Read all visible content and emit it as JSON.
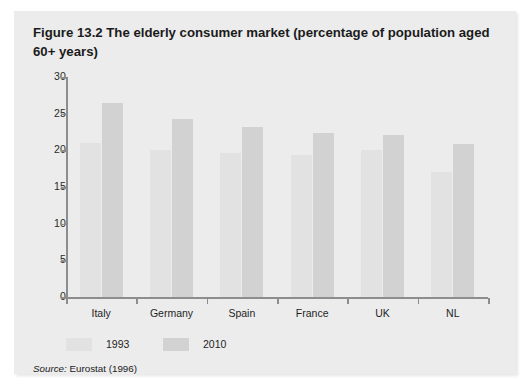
{
  "figure": {
    "label": "Figure 13.2",
    "caption": "The elderly consumer market (percentage of population aged 60+ years)",
    "source_label": "Source:",
    "source_text": "Eurostat (1996)"
  },
  "colors": {
    "card_background": "#ececec",
    "series_1993": "#e2e2e2",
    "series_2010": "#d2d2d2",
    "axis": "#8d8d8d",
    "text": "#1f1f1f"
  },
  "chart_data": {
    "type": "bar",
    "title": "Figure 13.2 The elderly consumer market (percentage of population aged 60+ years)",
    "xlabel": "",
    "ylabel": "",
    "ylim": [
      0,
      30
    ],
    "yticks": [
      0,
      5,
      10,
      15,
      20,
      25,
      30
    ],
    "grid": false,
    "legend_position": "bottom-left",
    "categories": [
      "Italy",
      "Germany",
      "Spain",
      "France",
      "UK",
      "NL"
    ],
    "series": [
      {
        "name": "1993",
        "values": [
          21.0,
          20.0,
          19.7,
          19.3,
          20.1,
          17.0
        ]
      },
      {
        "name": "2010",
        "values": [
          26.4,
          24.3,
          23.2,
          22.3,
          22.1,
          20.8
        ]
      }
    ]
  }
}
